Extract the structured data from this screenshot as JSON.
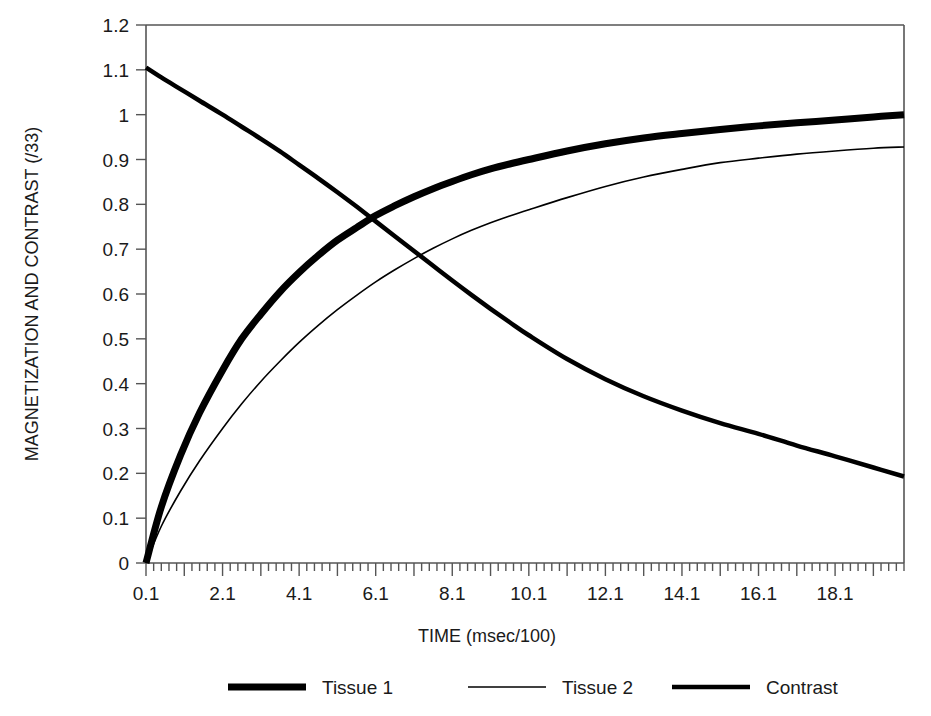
{
  "chart_data": {
    "type": "line",
    "title": "",
    "xlabel": "TIME (msec/100)",
    "ylabel": "MAGNETIZATION AND CONTRAST (/33)",
    "xlim": [
      0.1,
      19.9
    ],
    "ylim": [
      0,
      1.2
    ],
    "grid": false,
    "legend_position": "bottom",
    "x_tick_labels": [
      "0.1",
      "2.1",
      "4.1",
      "6.1",
      "8.1",
      "10.1",
      "12.1",
      "14.1",
      "16.1",
      "18.1"
    ],
    "x_tick_values": [
      0.1,
      2.1,
      4.1,
      6.1,
      8.1,
      10.1,
      12.1,
      14.1,
      16.1,
      18.1
    ],
    "x_minor_tick_step": 0.2,
    "x_major_tick_step": 1.0,
    "y_tick_labels": [
      "0",
      "0.1",
      "0.2",
      "0.3",
      "0.4",
      "0.5",
      "0.6",
      "0.7",
      "0.8",
      "0.9",
      "1",
      "1.1",
      "1.2"
    ],
    "y_tick_values": [
      0,
      0.1,
      0.2,
      0.3,
      0.4,
      0.5,
      0.6,
      0.7,
      0.8,
      0.9,
      1.0,
      1.1,
      1.2
    ],
    "x": [
      0.1,
      0.5,
      1.0,
      1.5,
      2.1,
      2.6,
      3.1,
      3.6,
      4.1,
      4.6,
      5.1,
      5.6,
      6.1,
      6.6,
      7.1,
      7.6,
      8.1,
      8.6,
      9.1,
      9.6,
      10.1,
      11.1,
      12.1,
      13.1,
      14.1,
      15.1,
      16.1,
      17.1,
      18.1,
      19.1,
      19.9
    ],
    "series": [
      {
        "name": "Tissue 1",
        "line_width": 7,
        "color": "#000000",
        "values": [
          0.0,
          0.125,
          0.24,
          0.335,
          0.43,
          0.5,
          0.555,
          0.605,
          0.648,
          0.686,
          0.72,
          0.748,
          0.775,
          0.797,
          0.817,
          0.835,
          0.851,
          0.866,
          0.879,
          0.89,
          0.9,
          0.919,
          0.935,
          0.948,
          0.958,
          0.967,
          0.975,
          0.982,
          0.988,
          0.995,
          1.0
        ]
      },
      {
        "name": "Tissue 2",
        "line_width": 1.6,
        "color": "#000000",
        "values": [
          0.0,
          0.082,
          0.16,
          0.228,
          0.3,
          0.355,
          0.405,
          0.45,
          0.492,
          0.53,
          0.565,
          0.597,
          0.627,
          0.654,
          0.679,
          0.702,
          0.723,
          0.742,
          0.759,
          0.774,
          0.788,
          0.815,
          0.84,
          0.861,
          0.878,
          0.893,
          0.903,
          0.912,
          0.919,
          0.925,
          0.928
        ]
      },
      {
        "name": "Contrast",
        "line_width": 4.5,
        "color": "#000000",
        "values": [
          1.105,
          1.083,
          1.057,
          1.031,
          1.0,
          0.973,
          0.946,
          0.918,
          0.888,
          0.858,
          0.827,
          0.795,
          0.762,
          0.729,
          0.696,
          0.663,
          0.63,
          0.598,
          0.567,
          0.537,
          0.508,
          0.455,
          0.41,
          0.372,
          0.34,
          0.312,
          0.288,
          0.262,
          0.238,
          0.213,
          0.193
        ]
      }
    ]
  },
  "legend": {
    "items": [
      {
        "label": "Tissue 1",
        "swatch": "thick-line-swatch"
      },
      {
        "label": "Tissue 2",
        "swatch": "thin-line-swatch"
      },
      {
        "label": "Contrast",
        "swatch": "medium-line-swatch"
      }
    ]
  },
  "colors": {
    "series": "#000000",
    "axis": "#555555",
    "text": "#1a1a1a",
    "background": "#ffffff"
  }
}
